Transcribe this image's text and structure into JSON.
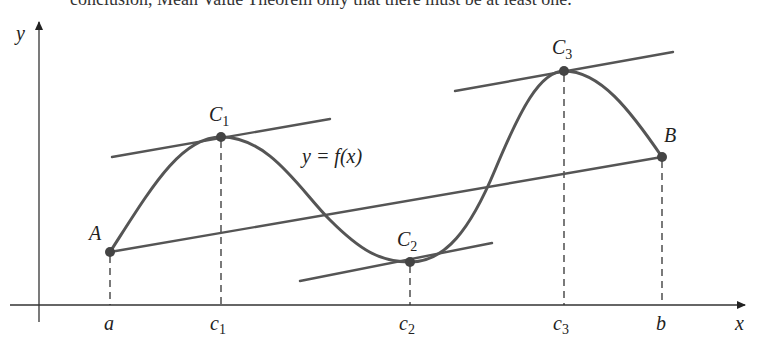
{
  "top_text": "conclusion, Mean Value Theorem only that there must be at least one.",
  "axes": {
    "x_label": "x",
    "y_label": "y"
  },
  "function_label": "y = f(x)",
  "points": [
    {
      "name": "A",
      "label": "A",
      "sub": ""
    },
    {
      "name": "C1",
      "label": "C",
      "sub": "1"
    },
    {
      "name": "C2",
      "label": "C",
      "sub": "2"
    },
    {
      "name": "C3",
      "label": "C",
      "sub": "3"
    },
    {
      "name": "B",
      "label": "B",
      "sub": ""
    }
  ],
  "x_ticks": [
    {
      "label": "a",
      "sub": ""
    },
    {
      "label": "c",
      "sub": "1"
    },
    {
      "label": "c",
      "sub": "2"
    },
    {
      "label": "c",
      "sub": "3"
    },
    {
      "label": "b",
      "sub": ""
    }
  ],
  "colors": {
    "curve": "#555555",
    "axis": "#333333",
    "point": "#444444"
  }
}
